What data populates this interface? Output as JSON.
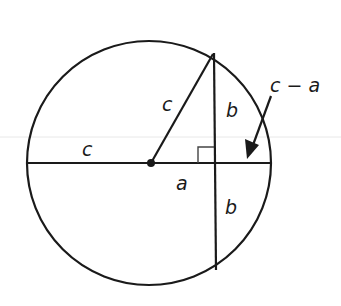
{
  "diagram": {
    "type": "geometry",
    "colors": {
      "stroke": "#1a1a1a",
      "background": "#ffffff",
      "artifact": "#e6e6e6"
    },
    "circle": {
      "cx": 149,
      "cy": 163,
      "r": 122
    },
    "center_point": {
      "x": 151,
      "y": 163
    },
    "labels": {
      "radius_left": "c",
      "radius_slanted": "c",
      "half_chord_top": "b",
      "half_chord_bottom": "b",
      "offset": "a",
      "segment": "c − a"
    }
  }
}
